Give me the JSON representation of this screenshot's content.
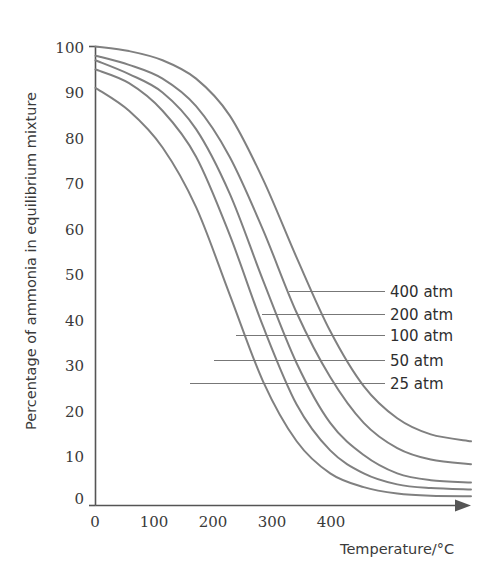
{
  "chart_data": {
    "type": "line",
    "title": "",
    "xlabel": "Temperature/°C",
    "ylabel": "Percentage of ammonia in equilibrium mixture",
    "xlim": [
      0,
      560
    ],
    "ylim": [
      0,
      100
    ],
    "xticks": [
      "0",
      "100",
      "200",
      "300",
      "400"
    ],
    "xtick_values": [
      0,
      100,
      200,
      300,
      400
    ],
    "yticks": [
      "0",
      "10",
      "20",
      "30",
      "40",
      "50",
      "60",
      "70",
      "80",
      "90",
      "100"
    ],
    "ytick_values": [
      0,
      10,
      20,
      30,
      40,
      50,
      60,
      70,
      80,
      90,
      100
    ],
    "grid": false,
    "legend_position": "right-inline-leader-lines",
    "x": [
      0,
      50,
      100,
      150,
      200,
      250,
      300,
      350,
      400,
      450,
      500,
      560
    ],
    "series": [
      {
        "name": "400 atm",
        "label": "400 atm",
        "color": "#808080",
        "values": [
          100,
          99,
          97,
          93,
          85,
          71,
          54,
          38,
          26,
          19,
          15.5,
          14
        ]
      },
      {
        "name": "200 atm",
        "label": "200 atm",
        "color": "#808080",
        "values": [
          98,
          96,
          93,
          87,
          76,
          60,
          42,
          28,
          18,
          12.5,
          10,
          9
        ]
      },
      {
        "name": "100 atm",
        "label": "100 atm",
        "color": "#808080",
        "values": [
          97,
          94,
          90,
          82,
          68,
          49,
          31,
          18,
          11,
          7,
          5.5,
          5
        ]
      },
      {
        "name": "50 atm",
        "label": "50 atm",
        "color": "#808080",
        "values": [
          95,
          92,
          86,
          76,
          59,
          39,
          22,
          12,
          7,
          4.6,
          3.8,
          3.5
        ]
      },
      {
        "name": "25 atm",
        "label": "25 atm",
        "color": "#808080",
        "values": [
          91,
          86,
          78,
          65,
          46,
          27,
          14,
          7,
          4,
          2.6,
          2.1,
          2
        ]
      }
    ]
  },
  "axes": {
    "y_title": "Percentage of ammonia in equilibrium mixture",
    "x_title": "Temperature/°C"
  },
  "legend": {
    "entries": [
      {
        "label": "400 atm"
      },
      {
        "label": "200 atm"
      },
      {
        "label": "100 atm"
      },
      {
        "label": "50 atm"
      },
      {
        "label": "25 atm"
      }
    ]
  },
  "ticks": {
    "y": [
      "100",
      "90",
      "80",
      "70",
      "60",
      "50",
      "40",
      "30",
      "20",
      "10",
      "0"
    ],
    "x": [
      "0",
      "100",
      "200",
      "300",
      "400"
    ]
  },
  "colors": {
    "curve": "#808080",
    "axis": "#555555",
    "text": "#3a3a3a",
    "background": "#ffffff"
  }
}
